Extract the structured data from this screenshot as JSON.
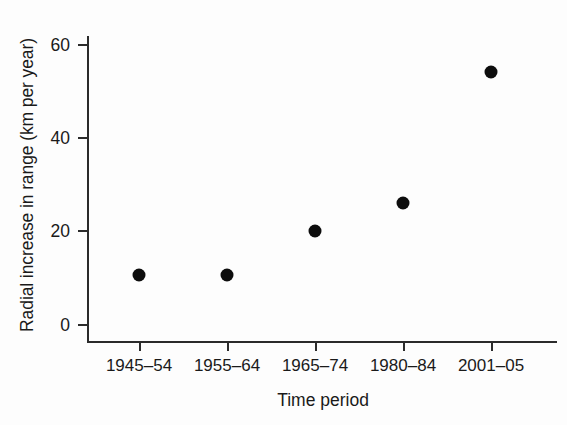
{
  "chart_data": {
    "type": "scatter",
    "title": "",
    "xlabel": "Time period",
    "ylabel": "Radial increase in range (km per year)",
    "categories": [
      "1945–54",
      "1955–64",
      "1965–74",
      "1980–84",
      "2001–05"
    ],
    "values": [
      10.5,
      10.5,
      20,
      26,
      54
    ],
    "ylim": [
      0,
      64
    ],
    "yticks": [
      0,
      20,
      40,
      60
    ],
    "ytick_labels": [
      "0",
      "20",
      "40",
      "60"
    ],
    "grid": false,
    "legend": null,
    "marker": {
      "shape": "filled-circle",
      "color": "#0d0d0d",
      "size_px": 13
    },
    "axis_color": "#2b2b2b",
    "background_color": "#fdfdfd"
  },
  "figure": {
    "x_axis_title": "Time period",
    "y_axis_title": "Radial increase in range (km per year)"
  }
}
